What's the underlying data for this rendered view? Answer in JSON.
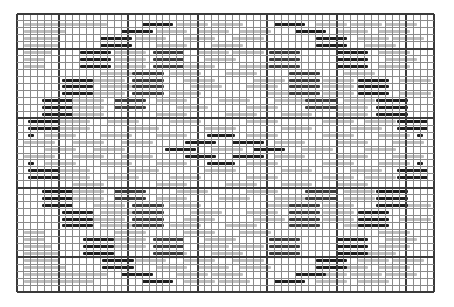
{
  "chart": {
    "kind": "knitting-pattern-grid",
    "cols": 60,
    "rows": 40,
    "cell_px": 6.95,
    "thick_every": 10,
    "thick_col_offset": 6,
    "thick_row_offset": 5,
    "colors": {
      "background": "#ffffff",
      "grid_thin": "#8a8a8a",
      "grid_thick": "#3a3a3a",
      "stitch_dark": "#1e1e1e",
      "stitch_mid": "#3c3c3c",
      "stitch_light": "#bdbdbd"
    },
    "dash_len": 4.5,
    "dark_segments": [
      [
        1,
        18
      ],
      [
        1,
        37
      ],
      [
        2,
        15
      ],
      [
        2,
        40
      ],
      [
        3,
        12
      ],
      [
        3,
        43
      ],
      [
        4,
        12
      ],
      [
        4,
        43
      ],
      [
        5,
        9
      ],
      [
        5,
        46
      ],
      [
        6,
        9
      ],
      [
        6,
        46
      ],
      [
        7,
        9
      ],
      [
        7,
        46
      ],
      [
        9,
        6.5
      ],
      [
        9,
        49
      ],
      [
        10,
        6.5
      ],
      [
        10,
        49
      ],
      [
        11,
        6.5
      ],
      [
        11,
        49
      ],
      [
        12,
        3.6
      ],
      [
        12,
        51.7
      ],
      [
        13,
        3.6
      ],
      [
        13,
        51.7
      ],
      [
        14,
        3.6
      ],
      [
        14,
        51.7
      ],
      [
        15,
        1.6
      ],
      [
        15,
        54.7
      ],
      [
        16,
        1.6
      ],
      [
        16,
        54.7
      ],
      [
        17,
        1.6,
        0.8
      ],
      [
        17,
        57.6,
        0.8
      ],
      [
        21,
        1.6,
        0.8
      ],
      [
        21,
        57.6,
        0.8
      ],
      [
        22,
        1.6
      ],
      [
        22,
        54.7
      ],
      [
        23,
        1.6
      ],
      [
        23,
        54.7
      ],
      [
        25,
        3.6
      ],
      [
        25,
        51.7
      ],
      [
        26,
        3.6
      ],
      [
        26,
        51.7
      ],
      [
        27,
        3.6
      ],
      [
        27,
        51.7
      ],
      [
        28,
        6.5
      ],
      [
        28,
        49
      ],
      [
        29,
        6.5
      ],
      [
        29,
        49
      ],
      [
        30,
        6.5
      ],
      [
        30,
        49
      ],
      [
        32,
        9.5
      ],
      [
        32,
        46
      ],
      [
        33,
        9.5
      ],
      [
        33,
        46
      ],
      [
        34,
        9.5
      ],
      [
        34,
        46
      ],
      [
        35,
        12.3
      ],
      [
        35,
        43
      ],
      [
        36,
        12.3
      ],
      [
        36,
        43
      ],
      [
        37,
        15
      ],
      [
        37,
        40
      ],
      [
        38,
        18
      ],
      [
        38,
        37
      ],
      [
        17,
        27.4,
        4
      ],
      [
        18,
        24.2
      ],
      [
        18,
        31
      ],
      [
        19,
        21.3
      ],
      [
        19,
        34
      ],
      [
        20,
        24.2
      ],
      [
        20,
        31
      ],
      [
        21,
        27.4,
        4
      ]
    ],
    "mid_segments": [
      [
        5,
        19.5
      ],
      [
        5,
        36.2
      ],
      [
        6,
        19.5
      ],
      [
        6,
        36.2
      ],
      [
        7,
        19.5
      ],
      [
        7,
        36.2
      ],
      [
        8,
        16.6
      ],
      [
        8,
        39.1
      ],
      [
        9,
        16.6
      ],
      [
        9,
        39.1
      ],
      [
        10,
        16.6
      ],
      [
        10,
        39.1
      ],
      [
        11,
        16.6
      ],
      [
        11,
        39.1
      ],
      [
        12,
        14
      ],
      [
        12,
        41.5
      ],
      [
        13,
        14
      ],
      [
        13,
        41.5
      ],
      [
        25,
        14
      ],
      [
        25,
        41.5
      ],
      [
        26,
        14
      ],
      [
        26,
        41.5
      ],
      [
        27,
        16.6
      ],
      [
        27,
        39.1
      ],
      [
        28,
        16.6
      ],
      [
        28,
        39.1
      ],
      [
        29,
        16.6
      ],
      [
        29,
        39.1
      ],
      [
        30,
        16.6
      ],
      [
        30,
        39.1
      ],
      [
        32,
        19.5
      ],
      [
        32,
        36.2
      ],
      [
        33,
        19.5
      ],
      [
        33,
        36.2
      ],
      [
        34,
        19.5
      ],
      [
        34,
        36.2
      ]
    ],
    "light_segments": [
      [
        1,
        1,
        8
      ],
      [
        1,
        8.5
      ],
      [
        1,
        23
      ],
      [
        1,
        28
      ],
      [
        1,
        43
      ],
      [
        1,
        48
      ],
      [
        1,
        53
      ],
      [
        2,
        1,
        6
      ],
      [
        2,
        20
      ],
      [
        2,
        26
      ],
      [
        2,
        32
      ],
      [
        2,
        46
      ],
      [
        2,
        52
      ],
      [
        3,
        1,
        5
      ],
      [
        3,
        17
      ],
      [
        3,
        24
      ],
      [
        3,
        31
      ],
      [
        3,
        49
      ],
      [
        3,
        54
      ],
      [
        4,
        1,
        5
      ],
      [
        4,
        20
      ],
      [
        4,
        28
      ],
      [
        4,
        50
      ],
      [
        5,
        1,
        4
      ],
      [
        5,
        14
      ],
      [
        5,
        26
      ],
      [
        5,
        31
      ],
      [
        5,
        52
      ],
      [
        6,
        1,
        3
      ],
      [
        6,
        14
      ],
      [
        6,
        27
      ],
      [
        6,
        53
      ],
      [
        7,
        1,
        3
      ],
      [
        7,
        14
      ],
      [
        7,
        24
      ],
      [
        7,
        32
      ],
      [
        7,
        52
      ],
      [
        8,
        12
      ],
      [
        8,
        22
      ],
      [
        8,
        30
      ],
      [
        8,
        47
      ],
      [
        9,
        11
      ],
      [
        9,
        24
      ],
      [
        9,
        34
      ],
      [
        9,
        44
      ],
      [
        9,
        55
      ],
      [
        10,
        12
      ],
      [
        10,
        25
      ],
      [
        10,
        33
      ],
      [
        10,
        44
      ],
      [
        11,
        11
      ],
      [
        11,
        22
      ],
      [
        11,
        36
      ],
      [
        11,
        44
      ],
      [
        11,
        55
      ],
      [
        12,
        8
      ],
      [
        12,
        20
      ],
      [
        12,
        29
      ],
      [
        12,
        37
      ],
      [
        12,
        47
      ],
      [
        13,
        8
      ],
      [
        13,
        23
      ],
      [
        13,
        33
      ],
      [
        13,
        46
      ],
      [
        14,
        8
      ],
      [
        14,
        20
      ],
      [
        14,
        30
      ],
      [
        14,
        38
      ],
      [
        14,
        46
      ],
      [
        15,
        6
      ],
      [
        15,
        13
      ],
      [
        15,
        22
      ],
      [
        15,
        33
      ],
      [
        15,
        44
      ],
      [
        15,
        50
      ],
      [
        16,
        6
      ],
      [
        16,
        16
      ],
      [
        16,
        27
      ],
      [
        16,
        38
      ],
      [
        16,
        48
      ],
      [
        17,
        4
      ],
      [
        17,
        12
      ],
      [
        17,
        20
      ],
      [
        17,
        33
      ],
      [
        17,
        44
      ],
      [
        17,
        52
      ],
      [
        18,
        1
      ],
      [
        18,
        8
      ],
      [
        18,
        15
      ],
      [
        18,
        37
      ],
      [
        18,
        46
      ],
      [
        18,
        54
      ],
      [
        19,
        4
      ],
      [
        19,
        11
      ],
      [
        19,
        28
      ],
      [
        19,
        41
      ],
      [
        19,
        50
      ],
      [
        20,
        1
      ],
      [
        20,
        8
      ],
      [
        20,
        15
      ],
      [
        20,
        37
      ],
      [
        20,
        46
      ],
      [
        20,
        54
      ],
      [
        21,
        4
      ],
      [
        21,
        12
      ],
      [
        21,
        20
      ],
      [
        21,
        33
      ],
      [
        21,
        44
      ],
      [
        21,
        52
      ],
      [
        22,
        6
      ],
      [
        22,
        16
      ],
      [
        22,
        27
      ],
      [
        22,
        38
      ],
      [
        22,
        48
      ],
      [
        23,
        6
      ],
      [
        23,
        13
      ],
      [
        23,
        22
      ],
      [
        23,
        33
      ],
      [
        23,
        44
      ],
      [
        23,
        50
      ],
      [
        24,
        8
      ],
      [
        24,
        20
      ],
      [
        24,
        30
      ],
      [
        24,
        38
      ],
      [
        24,
        46
      ],
      [
        25,
        8
      ],
      [
        25,
        23
      ],
      [
        25,
        33
      ],
      [
        25,
        47
      ],
      [
        26,
        8
      ],
      [
        26,
        20
      ],
      [
        26,
        29
      ],
      [
        26,
        37
      ],
      [
        26,
        47
      ],
      [
        27,
        11
      ],
      [
        27,
        22
      ],
      [
        27,
        36
      ],
      [
        27,
        44
      ],
      [
        27,
        55
      ],
      [
        28,
        12
      ],
      [
        28,
        25
      ],
      [
        28,
        33
      ],
      [
        28,
        44
      ],
      [
        29,
        11
      ],
      [
        29,
        24
      ],
      [
        29,
        34
      ],
      [
        29,
        44
      ],
      [
        29,
        55
      ],
      [
        30,
        12
      ],
      [
        30,
        22
      ],
      [
        30,
        30
      ],
      [
        30,
        47
      ],
      [
        31,
        1,
        3
      ],
      [
        31,
        14
      ],
      [
        31,
        24
      ],
      [
        31,
        32
      ],
      [
        31,
        52
      ],
      [
        32,
        1,
        3
      ],
      [
        32,
        14
      ],
      [
        32,
        27
      ],
      [
        32,
        53
      ],
      [
        33,
        1,
        4
      ],
      [
        33,
        14
      ],
      [
        33,
        26
      ],
      [
        33,
        31
      ],
      [
        33,
        52
      ],
      [
        34,
        1,
        5
      ],
      [
        34,
        20
      ],
      [
        34,
        28
      ],
      [
        34,
        50
      ],
      [
        35,
        1,
        5
      ],
      [
        35,
        17
      ],
      [
        35,
        24
      ],
      [
        35,
        31
      ],
      [
        35,
        49
      ],
      [
        35,
        54
      ],
      [
        36,
        1,
        6
      ],
      [
        36,
        20
      ],
      [
        36,
        26
      ],
      [
        36,
        32
      ],
      [
        36,
        46
      ],
      [
        36,
        52
      ],
      [
        37,
        1,
        8
      ],
      [
        37,
        8.5
      ],
      [
        37,
        23
      ],
      [
        37,
        28
      ],
      [
        37,
        43
      ],
      [
        37,
        48
      ],
      [
        37,
        53
      ],
      [
        38,
        1,
        10
      ],
      [
        38,
        24
      ],
      [
        38,
        29
      ],
      [
        38,
        43
      ],
      [
        38,
        49
      ]
    ]
  }
}
